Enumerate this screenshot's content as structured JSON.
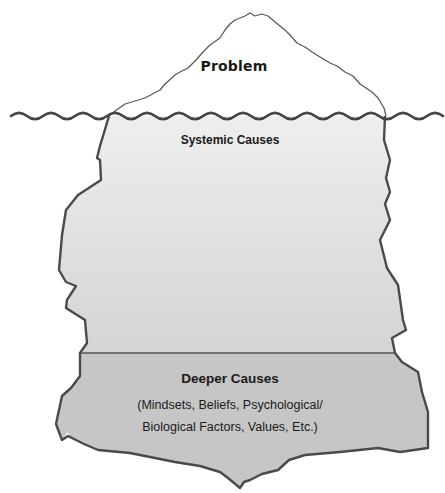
{
  "diagram": {
    "type": "iceberg-model",
    "colors": {
      "outline": "#4a4a4a",
      "water_line": "#444444",
      "systemic_fill_top": "#eeeeee",
      "systemic_fill_bottom": "#d4d4d4",
      "deeper_fill": "#c6c6c6",
      "background": "#ffffff"
    },
    "layers": [
      {
        "id": "problem",
        "title": "Problem",
        "position": "above water"
      },
      {
        "id": "systemic",
        "title": "Systemic Causes",
        "position": "below water"
      },
      {
        "id": "deeper",
        "title": "Deeper Causes",
        "description_lines": [
          "(Mindsets, Beliefs, Psychological/",
          "Biological Factors, Values, Etc.)"
        ],
        "position": "bottom"
      }
    ]
  }
}
